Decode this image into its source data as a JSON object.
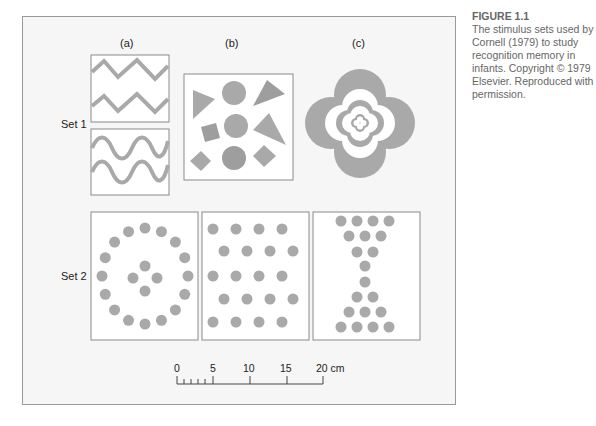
{
  "caption": {
    "figure_label": "FIGURE 1.1",
    "text": "The stimulus sets used by Cornell (1979) to study recognition memory in infants. Copyright © 1979 Elsevier. Reproduced with permission."
  },
  "columns": [
    "(a)",
    "(b)",
    "(c)"
  ],
  "rows": [
    "Set 1",
    "Set 2"
  ],
  "scale": {
    "ticks": [
      "0",
      "5",
      "10",
      "15",
      "20 cm"
    ]
  },
  "colors": {
    "shape": "#a9a9a9",
    "shape_dark": "#9e9e9e",
    "panel_border": "#8a8a8a",
    "frame_bg": "#f6f6f6"
  }
}
